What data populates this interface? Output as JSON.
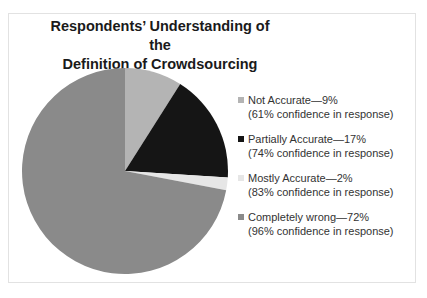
{
  "chart_data": {
    "type": "pie",
    "title_lines": [
      "Respondents’ Understanding of the",
      "Definition of Crowdsourcing"
    ],
    "categories": [
      "Not Accurate",
      "Partially Accurate",
      "Mostly Accurate",
      "Completely wrong"
    ],
    "values": [
      9,
      17,
      2,
      72
    ],
    "confidence": [
      61,
      74,
      83,
      96
    ],
    "colors": [
      "#b4b4b4",
      "#151515",
      "#e6e6e6",
      "#8a8a8a"
    ],
    "legend_position": "right"
  },
  "legend": [
    {
      "label": "Not Accurate—9%",
      "sub": "(61% confidence in response)",
      "color": "#b4b4b4"
    },
    {
      "label": "Partially Accurate—17%",
      "sub": "(74% confidence in response)",
      "color": "#151515"
    },
    {
      "label": "Mostly Accurate—2%",
      "sub": "(83% confidence in response)",
      "color": "#e6e6e6"
    },
    {
      "label": "Completely wrong—72%",
      "sub": "(96% confidence in response)",
      "color": "#8a8a8a"
    }
  ]
}
